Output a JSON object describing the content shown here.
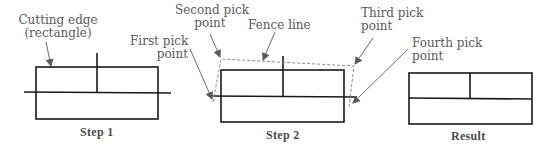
{
  "labels": {
    "cutting_edge": [
      "Cutting edge",
      "(rectangle)"
    ],
    "second_pick": [
      "Second pick",
      "point"
    ],
    "fence_line": "Fence line",
    "third_pick": [
      "Third pick",
      "point"
    ],
    "first_pick": [
      "First pick",
      "point"
    ],
    "fourth_pick": [
      "Fourth pick",
      "point"
    ]
  },
  "captions": {
    "step1": "Step 1",
    "step2": "Step 2",
    "result": "Result"
  },
  "colors": {
    "line": "#1a1a1a",
    "fence": "#8a8a8a",
    "leader": "#6a6a6a",
    "text": "#5a5a5a"
  }
}
